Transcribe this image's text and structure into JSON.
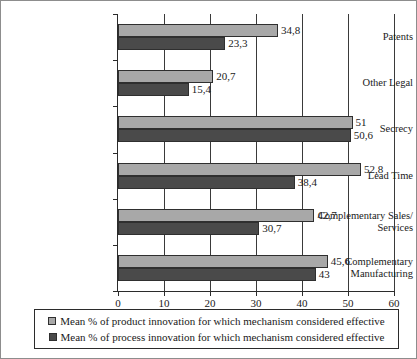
{
  "chart_data": {
    "type": "bar",
    "orientation": "horizontal",
    "title": "",
    "xlabel": "",
    "ylabel": "",
    "xlim": [
      0,
      60
    ],
    "xticks": [
      0,
      10,
      20,
      30,
      40,
      50,
      60
    ],
    "xtick_labels": [
      "0",
      "10",
      "20",
      "30",
      "40",
      "50",
      "60"
    ],
    "grid": "vertical",
    "legend_position": "bottom",
    "decimal_separator": ",",
    "categories": [
      "Patents",
      "Other Legal",
      "Secrecy",
      "Lead Time",
      "Complementary Sales/ Services",
      "Complementary Manufacturing"
    ],
    "category_lines": [
      [
        "Patents"
      ],
      [
        "Other Legal"
      ],
      [
        "Secrecy"
      ],
      [
        "Lead Time"
      ],
      [
        "Complementary Sales/",
        "Services"
      ],
      [
        "Complementary",
        "Manufacturing"
      ]
    ],
    "series": [
      {
        "name": "Mean % of product innovation for which mechanism considered effective",
        "key": "product",
        "color": "#a8a8a8",
        "values": [
          34.8,
          20.7,
          51,
          52.8,
          42.7,
          45.6
        ],
        "labels": [
          "34,8",
          "20,7",
          "51",
          "52,8",
          "42,7",
          "45,6"
        ]
      },
      {
        "name": "Mean % of process innovation for which mechanism considered effective",
        "key": "process",
        "color": "#4a4a4a",
        "values": [
          23.3,
          15.4,
          50.6,
          38.4,
          30.7,
          43
        ],
        "labels": [
          "23,3",
          "15,4",
          "50,6",
          "38,4",
          "30,7",
          "43"
        ]
      }
    ]
  },
  "legend": {
    "entries": [
      {
        "swatch": "product",
        "label": "Mean % of product innovation for which mechanism considered effective"
      },
      {
        "swatch": "process",
        "label": "Mean % of process innovation for which mechanism considered effective"
      }
    ]
  }
}
